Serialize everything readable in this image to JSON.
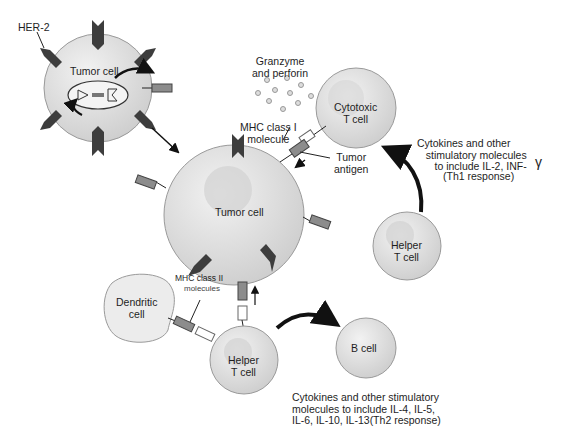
{
  "diagram": {
    "type": "immune-response-to-tumor",
    "colors": {
      "cell_fill": "#dcdcdc",
      "cell_stroke": "#9a9a9a",
      "nucleus": "#cfcfcf",
      "her2": "#3d3d3d",
      "arrow": "#111111",
      "receptor": "#8c8c8c"
    },
    "labels": {
      "her2": "HER-2",
      "tumor_cell_small": "Tumor cell",
      "granzyme": "Granzyme\nand perforin",
      "cytotoxic_t": "Cytotoxic\nT cell",
      "mhc1": "MHC class I\nmolecule",
      "tumor_antigen": "Tumor\nantigen",
      "th1_text": "Cytokines and other\n   stimulatory molecules\n      to include IL-2, INF-",
      "gamma": "γ",
      "th1_response": "(Th1 response)",
      "tumor_cell_main": "Tumor cell",
      "helper_t_upper": "Helper\nT cell",
      "mhc2": "MHC class II",
      "mhc2_sub": "molecules",
      "dendritic": "Dendritic\ncell",
      "helper_t_lower": "Helper\nT cell",
      "b_cell": "B cell",
      "th2_text": "Cytokines and other stimulatory\nmolecules to include IL-4, IL-5,\nIL-6, IL-10, IL-13(Th2 response)"
    }
  }
}
